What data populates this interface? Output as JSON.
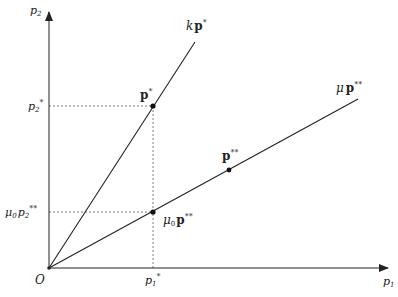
{
  "diagram": {
    "axes": {
      "x_label": "p",
      "x_label_sub": "1",
      "y_label": "p",
      "y_label_sub": "2",
      "origin_label": "O"
    },
    "rays": [
      {
        "name": "k-p-star",
        "label_coef": "k",
        "label_vec": "p",
        "label_sup": "*"
      },
      {
        "name": "mu-p-double-star",
        "label_coef": "μ",
        "label_vec": "p",
        "label_sup": "**"
      }
    ],
    "points": [
      {
        "name": "p-star",
        "label_vec": "p",
        "label_sup": "*"
      },
      {
        "name": "p-double-star",
        "label_vec": "p",
        "label_sup": "**"
      },
      {
        "name": "mu0-p-double-star",
        "label_coef": "μ",
        "label_coef_sub": "0",
        "label_vec": "p",
        "label_sup": "**"
      }
    ],
    "tick_labels": {
      "p1_star": {
        "base": "p",
        "sub": "1",
        "sup": "*"
      },
      "p2_star": {
        "base": "p",
        "sub": "2",
        "sup": "*"
      },
      "mu0_p2_double_star": {
        "coef": "μ",
        "coef_sub": "0",
        "base": "p",
        "sub": "2",
        "sup": "**"
      }
    }
  }
}
